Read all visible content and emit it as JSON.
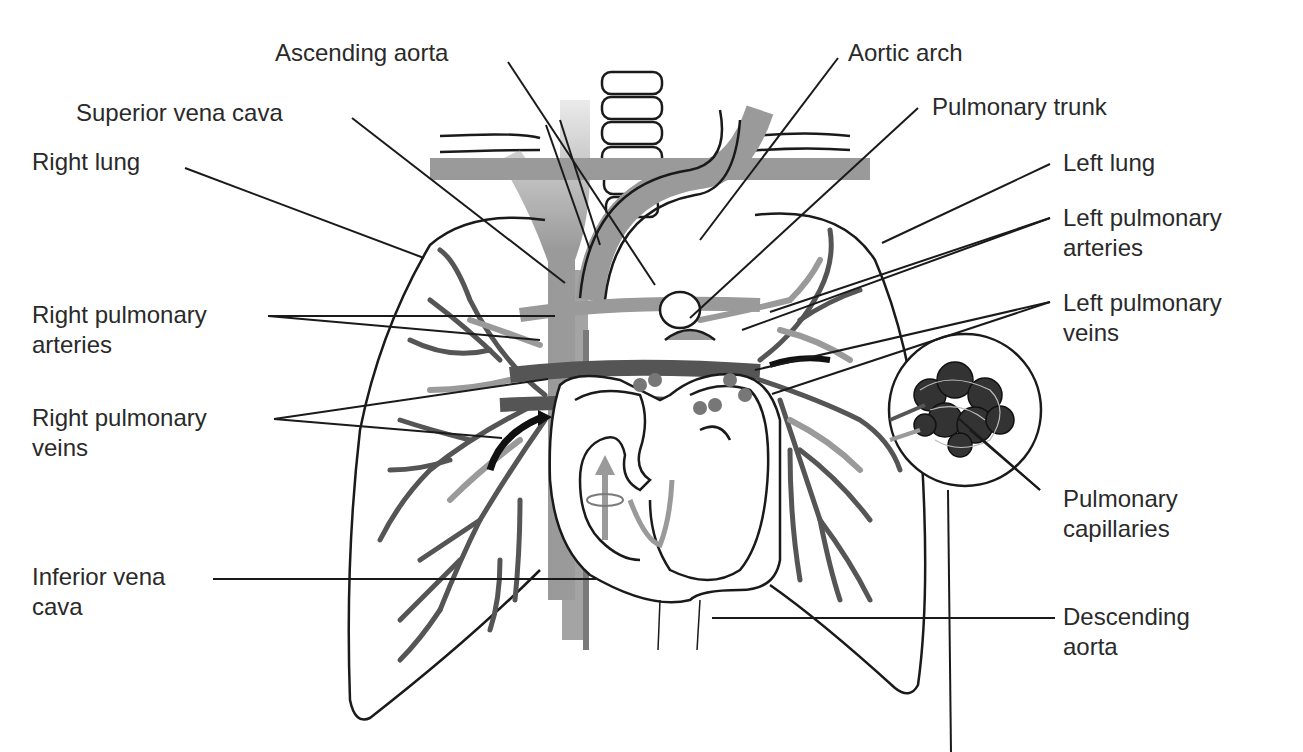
{
  "diagram": {
    "title_fragment_visible": true,
    "colors": {
      "background": "#ffffff",
      "outline": "#1a1a1a",
      "vessel_dark": "#555555",
      "vessel_light": "#9a9a9a",
      "vessel_mid": "#7a7a7a",
      "label_text": "#2a2a2a"
    },
    "labels": {
      "ascending_aorta": {
        "line1": "Ascending aorta"
      },
      "aortic_arch": {
        "line1": "Aortic arch"
      },
      "superior_vena_cava": {
        "line1": "Superior vena cava"
      },
      "pulmonary_trunk": {
        "line1": "Pulmonary trunk"
      },
      "right_lung": {
        "line1": "Right lung"
      },
      "left_lung": {
        "line1": "Left lung"
      },
      "left_pulmonary_arteries": {
        "line1": "Left pulmonary",
        "line2": "arteries"
      },
      "right_pulmonary_arteries": {
        "line1": "Right pulmonary",
        "line2": "arteries"
      },
      "left_pulmonary_veins": {
        "line1": "Left pulmonary",
        "line2": "veins"
      },
      "right_pulmonary_veins": {
        "line1": "Right pulmonary",
        "line2": "veins"
      },
      "pulmonary_capillaries": {
        "line1": "Pulmonary",
        "line2": "capillaries"
      },
      "inferior_vena_cava": {
        "line1": "Inferior vena",
        "line2": "cava"
      },
      "descending_aorta": {
        "line1": "Descending",
        "line2": "aorta"
      }
    }
  }
}
